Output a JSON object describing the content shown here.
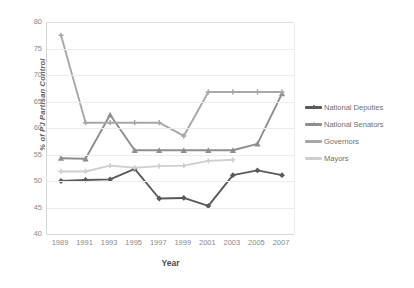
{
  "top_partial_text": "",
  "axes": {
    "ylabel": "% of PJ Partisan Control",
    "xlabel": "Year",
    "yticks": [
      "80",
      "75",
      "70",
      "65",
      "60",
      "55",
      "50",
      "45",
      "40"
    ],
    "xticks": [
      "1989",
      "1991",
      "1993",
      "1995",
      "1997",
      "1999",
      "2001",
      "2003",
      "2005",
      "2007"
    ]
  },
  "legend": {
    "items": [
      {
        "label": "National Deputies",
        "color": "#5a5a5a",
        "marker": "diamond"
      },
      {
        "label": "National Senators",
        "color": "#8e8e8e",
        "marker": "triangle"
      },
      {
        "label": "Governors",
        "color": "#a8a8a8",
        "marker": "plus"
      },
      {
        "label": "Mayors",
        "color": "#cfcfcf",
        "marker": "plus"
      }
    ]
  },
  "chart_data": {
    "type": "line",
    "title": "",
    "xlabel": "Year",
    "ylabel": "% of PJ Partisan Control",
    "categories": [
      1989,
      1991,
      1993,
      1995,
      1997,
      1999,
      2001,
      2003,
      2005,
      2007
    ],
    "ylim": [
      40,
      80
    ],
    "ytick_step": 5,
    "grid": "horizontal",
    "legend_position": "right",
    "series": [
      {
        "name": "National Deputies",
        "color": "#5a5a5a",
        "marker": "diamond",
        "values": [
          50.0,
          50.2,
          50.3,
          52.3,
          46.7,
          46.8,
          45.3,
          51.1,
          52.0,
          51.1
        ]
      },
      {
        "name": "National Senators",
        "color": "#8e8e8e",
        "marker": "triangle",
        "values": [
          54.3,
          54.2,
          62.5,
          55.8,
          55.8,
          55.8,
          55.8,
          55.8,
          57.0,
          66.5
        ]
      },
      {
        "name": "Governors",
        "color": "#a8a8a8",
        "marker": "plus",
        "values": [
          77.5,
          61.0,
          61.0,
          61.0,
          61.0,
          58.5,
          66.8,
          66.8,
          66.8,
          66.8
        ]
      },
      {
        "name": "Mayors",
        "color": "#cfcfcf",
        "marker": "plus",
        "values": [
          51.8,
          51.8,
          52.9,
          52.5,
          52.8,
          52.9,
          53.8,
          54.0,
          null,
          null
        ]
      }
    ]
  }
}
